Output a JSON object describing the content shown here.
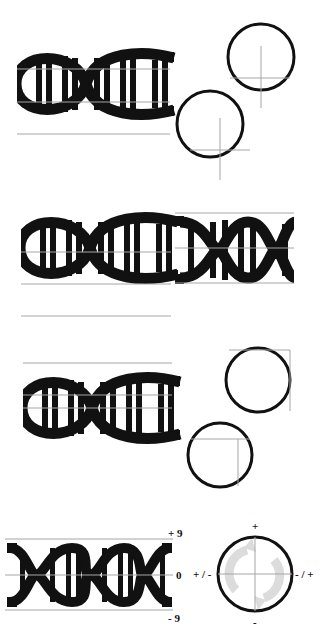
{
  "colors": {
    "ink": "#111111",
    "guide": "#a6a6a6",
    "faint_symbol": "#dcdcdc",
    "background": "#ffffff"
  },
  "panels": [
    {
      "name": "panel-1",
      "description": "DNA helix with guide lines and two circles with crosshair guides"
    },
    {
      "name": "panel-2",
      "description": "Two DNA helix variants with guide lines"
    },
    {
      "name": "panel-3",
      "description": "DNA helix with guide lines and two circles with corner guides"
    },
    {
      "name": "panel-4",
      "description": "DNA helix with scale and rotation dial"
    }
  ],
  "scale_labels": {
    "top": "+ 9",
    "middle": "0",
    "bottom": "- 9"
  },
  "dial_labels": {
    "top": "+",
    "bottom": "-",
    "left": "+ / -",
    "right": "- / +"
  },
  "icons": {
    "helix": "dna-helix-icon",
    "dial_symbol": "rotate-arrows-icon"
  }
}
